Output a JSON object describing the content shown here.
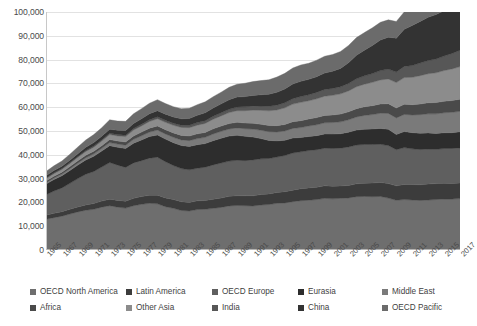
{
  "chart_data": {
    "type": "area",
    "stacked": true,
    "title": "",
    "xlabel": "",
    "ylabel": "",
    "ylim": [
      0,
      100000
    ],
    "ytick_step": 10000,
    "grid": true,
    "legend_position": "bottom",
    "y_ticks": [
      "0",
      "10,000",
      "20,000",
      "30,000",
      "40,000",
      "50,000",
      "60,000",
      "70,000",
      "80,000",
      "90,000",
      "100,000"
    ],
    "x": [
      1965,
      1966,
      1967,
      1968,
      1969,
      1970,
      1971,
      1972,
      1973,
      1974,
      1975,
      1976,
      1977,
      1978,
      1979,
      1980,
      1981,
      1982,
      1983,
      1984,
      1985,
      1986,
      1987,
      1988,
      1989,
      1990,
      1991,
      1992,
      1993,
      1994,
      1995,
      1996,
      1997,
      1998,
      1999,
      2000,
      2001,
      2002,
      2003,
      2004,
      2005,
      2006,
      2007,
      2008,
      2009,
      2010,
      2011,
      2012,
      2013,
      2014,
      2015,
      2016,
      2017
    ],
    "x_tick_labels": [
      "1965",
      "1967",
      "1969",
      "1971",
      "1973",
      "1975",
      "1977",
      "1979",
      "1981",
      "1983",
      "1985",
      "1987",
      "1989",
      "1991",
      "1993",
      "1995",
      "1997",
      "1999",
      "2001",
      "2003",
      "2005",
      "2007",
      "2009",
      "2011",
      "2013",
      "2015",
      "2017"
    ],
    "series": [
      {
        "name": "OECD North America",
        "color": "#6e6e6e",
        "values": [
          12900,
          13600,
          14200,
          15100,
          16000,
          16700,
          17100,
          18000,
          18600,
          18000,
          17600,
          18600,
          19200,
          19600,
          19400,
          18200,
          17500,
          16600,
          16400,
          17000,
          17100,
          17500,
          17900,
          18500,
          18700,
          18600,
          18500,
          18900,
          19100,
          19600,
          19800,
          20300,
          20700,
          20900,
          21200,
          21700,
          21500,
          21700,
          21900,
          22400,
          22500,
          22400,
          22500,
          21800,
          20900,
          21200,
          21000,
          20800,
          21000,
          21200,
          21400,
          21400,
          21600
        ]
      },
      {
        "name": "Latin America",
        "color": "#3c3c3c",
        "values": [
          1700,
          1800,
          1900,
          2000,
          2100,
          2250,
          2400,
          2550,
          2750,
          2850,
          2900,
          3100,
          3250,
          3400,
          3600,
          3700,
          3700,
          3700,
          3600,
          3650,
          3700,
          3850,
          3950,
          4050,
          4100,
          4150,
          4250,
          4400,
          4450,
          4550,
          4700,
          4850,
          5050,
          5200,
          5150,
          5250,
          5250,
          5200,
          5200,
          5400,
          5550,
          5700,
          5900,
          6100,
          6050,
          6350,
          6500,
          6600,
          6700,
          6700,
          6650,
          6550,
          6500
        ]
      },
      {
        "name": "OECD Europe",
        "color": "#5f5f5f",
        "values": [
          8600,
          9400,
          10000,
          10900,
          11900,
          12900,
          13500,
          14300,
          15400,
          14800,
          14200,
          14900,
          15100,
          15600,
          16000,
          15200,
          14300,
          13900,
          13700,
          13700,
          14000,
          14400,
          14700,
          14800,
          14900,
          14800,
          15100,
          15000,
          14900,
          14900,
          15200,
          15600,
          15500,
          15700,
          15800,
          15800,
          15900,
          15900,
          16200,
          16300,
          16300,
          16200,
          16000,
          16000,
          15200,
          15500,
          15000,
          14800,
          14700,
          14400,
          14600,
          14700,
          14800
        ]
      },
      {
        "name": "Eurasia",
        "color": "#2d2d2d",
        "values": [
          4500,
          4800,
          5100,
          5400,
          5700,
          6000,
          6350,
          6700,
          7100,
          7500,
          7900,
          8300,
          8700,
          9050,
          9350,
          9500,
          9600,
          9700,
          9800,
          9900,
          9900,
          10200,
          10400,
          10500,
          10500,
          10200,
          9600,
          8500,
          7600,
          6800,
          6400,
          6300,
          6000,
          5900,
          5900,
          6000,
          6050,
          6050,
          6200,
          6300,
          6400,
          6550,
          6700,
          6800,
          6400,
          6700,
          6800,
          6850,
          6800,
          6700,
          6600,
          6650,
          6750
        ]
      },
      {
        "name": "Middle East",
        "color": "#7a7a7a",
        "values": [
          600,
          650,
          700,
          780,
          850,
          950,
          1050,
          1150,
          1300,
          1350,
          1450,
          1600,
          1750,
          1900,
          2050,
          2150,
          2250,
          2350,
          2450,
          2550,
          2650,
          2800,
          2900,
          3000,
          3100,
          3200,
          3350,
          3500,
          3650,
          3750,
          3900,
          4050,
          4200,
          4400,
          4550,
          4700,
          4850,
          5000,
          5200,
          5500,
          5800,
          6050,
          6350,
          6700,
          6950,
          7200,
          7450,
          7800,
          8000,
          8200,
          8400,
          8550,
          8650
        ]
      },
      {
        "name": "Africa",
        "color": "#4a4a4a",
        "values": [
          700,
          750,
          800,
          860,
          930,
          1000,
          1070,
          1150,
          1250,
          1300,
          1350,
          1450,
          1550,
          1650,
          1750,
          1800,
          1850,
          1900,
          1950,
          2000,
          2050,
          2150,
          2200,
          2280,
          2350,
          2400,
          2450,
          2520,
          2580,
          2650,
          2720,
          2800,
          2880,
          2950,
          3020,
          3100,
          3180,
          3250,
          3350,
          3500,
          3620,
          3750,
          3900,
          4050,
          4150,
          4300,
          4300,
          4500,
          4650,
          4750,
          4850,
          4950,
          5050
        ]
      },
      {
        "name": "Other Asia",
        "color": "#8c8c8c",
        "values": [
          1000,
          1100,
          1200,
          1320,
          1450,
          1600,
          1750,
          1900,
          2100,
          2150,
          2250,
          2450,
          2600,
          2800,
          3000,
          3100,
          3200,
          3350,
          3500,
          3650,
          3800,
          4050,
          4300,
          4600,
          4900,
          5200,
          5500,
          5850,
          6200,
          6600,
          7000,
          7400,
          7700,
          7650,
          7900,
          8100,
          8250,
          8500,
          8800,
          9200,
          9500,
          9800,
          10100,
          10400,
          10700,
          11200,
          11500,
          11900,
          12200,
          12500,
          12900,
          13300,
          13700
        ]
      },
      {
        "name": "India",
        "color": "#575757",
        "values": [
          300,
          320,
          340,
          370,
          400,
          430,
          460,
          500,
          540,
          560,
          600,
          650,
          700,
          750,
          800,
          830,
          880,
          930,
          1000,
          1070,
          1140,
          1220,
          1300,
          1400,
          1500,
          1600,
          1700,
          1800,
          1900,
          2000,
          2150,
          2300,
          2450,
          2550,
          2700,
          2800,
          2900,
          3000,
          3150,
          3350,
          3500,
          3700,
          3950,
          4150,
          4450,
          4700,
          4950,
          5300,
          5550,
          5800,
          6100,
          6500,
          6900
        ]
      },
      {
        "name": "China",
        "color": "#333333",
        "values": [
          900,
          950,
          900,
          1000,
          1150,
          1300,
          1450,
          1550,
          1700,
          1800,
          1950,
          2100,
          2300,
          2500,
          2600,
          2600,
          2600,
          2700,
          2850,
          3050,
          3300,
          3500,
          3750,
          4000,
          4200,
          4300,
          4500,
          4750,
          5100,
          5400,
          5800,
          6150,
          6400,
          6450,
          6600,
          6900,
          7200,
          7700,
          8700,
          9900,
          10800,
          11800,
          12800,
          13400,
          14200,
          15600,
          16800,
          17500,
          18200,
          18700,
          19000,
          19400,
          19900
        ]
      },
      {
        "name": "OECD Pacific",
        "color": "#6b6b6b",
        "values": [
          1800,
          2000,
          2250,
          2500,
          2800,
          3100,
          3350,
          3600,
          3950,
          3850,
          3850,
          4100,
          4250,
          4400,
          4600,
          4450,
          4350,
          4250,
          4300,
          4500,
          4600,
          4750,
          4900,
          5200,
          5400,
          5600,
          5800,
          5950,
          6050,
          6400,
          6550,
          6700,
          6850,
          6750,
          6950,
          7050,
          7050,
          7100,
          7250,
          7400,
          7400,
          7400,
          7450,
          7300,
          7000,
          7300,
          7400,
          7500,
          7450,
          7350,
          7300,
          7350,
          7400
        ]
      }
    ]
  },
  "legend": {
    "items": [
      {
        "label": "OECD North America",
        "color": "#6e6e6e"
      },
      {
        "label": "Latin America",
        "color": "#3c3c3c"
      },
      {
        "label": "OECD Europe",
        "color": "#5f5f5f"
      },
      {
        "label": "Eurasia",
        "color": "#2d2d2d"
      },
      {
        "label": "Middle East",
        "color": "#7a7a7a"
      },
      {
        "label": "Africa",
        "color": "#4a4a4a"
      },
      {
        "label": "Other Asia",
        "color": "#8c8c8c"
      },
      {
        "label": "India",
        "color": "#575757"
      },
      {
        "label": "China",
        "color": "#333333"
      },
      {
        "label": "OECD Pacific",
        "color": "#6b6b6b"
      }
    ]
  }
}
